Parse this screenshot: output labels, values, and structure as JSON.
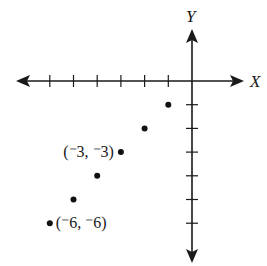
{
  "chart_data": {
    "type": "scatter",
    "title": "",
    "xlabel": "X",
    "ylabel": "Y",
    "xlim": [
      -6,
      0
    ],
    "ylim": [
      -6,
      0
    ],
    "x_ticks": [
      -6,
      -5,
      -4,
      -3,
      -2,
      -1
    ],
    "y_ticks": [
      -1,
      -2,
      -3,
      -4,
      -5,
      -6
    ],
    "tick_labels_shown": false,
    "grid": false,
    "points": [
      {
        "x": -1,
        "y": -1,
        "label": ""
      },
      {
        "x": -2,
        "y": -2,
        "label": ""
      },
      {
        "x": -3,
        "y": -3,
        "label": "(⁻3, ⁻3)"
      },
      {
        "x": -4,
        "y": -4,
        "label": ""
      },
      {
        "x": -5,
        "y": -5,
        "label": ""
      },
      {
        "x": -6,
        "y": -6,
        "label": "(⁻6, ⁻6)"
      }
    ]
  }
}
